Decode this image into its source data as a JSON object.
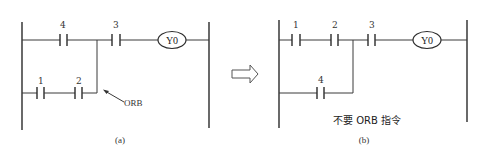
{
  "diagram": {
    "type": "plc-ladder-diagram-comparison",
    "panel_a": {
      "caption": "(a)",
      "top_rung": {
        "contacts": [
          {
            "label": "4"
          },
          {
            "label": "3"
          }
        ],
        "coil": "Y0"
      },
      "bottom_branch": {
        "contacts": [
          {
            "label": "1"
          },
          {
            "label": "2"
          }
        ]
      },
      "annotation": "ORB"
    },
    "arrow": "hollow-right-arrow",
    "panel_b": {
      "caption": "(b)",
      "top_rung": {
        "contacts": [
          {
            "label": "1"
          },
          {
            "label": "2"
          },
          {
            "label": "3"
          }
        ],
        "coil": "Y0"
      },
      "bottom_branch": {
        "contacts": [
          {
            "label": "4"
          }
        ]
      },
      "note": "不要 ORB 指令"
    }
  }
}
